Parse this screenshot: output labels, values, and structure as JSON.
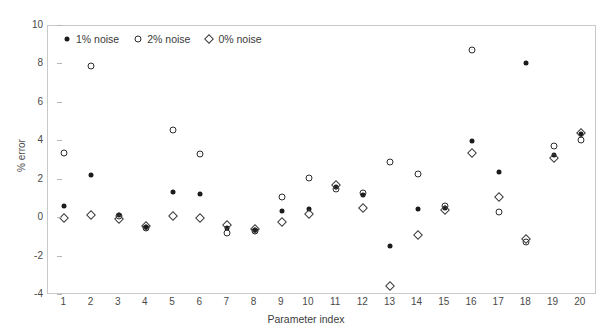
{
  "chart_data": {
    "type": "scatter",
    "title": "",
    "xlabel": "Parameter index",
    "ylabel": "% error",
    "xlim": [
      0.4,
      20.6
    ],
    "ylim": [
      -4,
      10
    ],
    "yticks": [
      10,
      8,
      6,
      4,
      2,
      0,
      -2,
      -4
    ],
    "ytick_labels": [
      "10",
      "8",
      "6",
      "4",
      "2",
      "0",
      "-2",
      "-4"
    ],
    "xticks": [
      1,
      2,
      3,
      4,
      5,
      6,
      7,
      8,
      9,
      10,
      11,
      12,
      13,
      14,
      15,
      16,
      17,
      18,
      19,
      20
    ],
    "xtick_labels": [
      "1",
      "2",
      "3",
      "4",
      "5",
      "6",
      "7",
      "8",
      "9",
      "10",
      "11",
      "12",
      "13",
      "14",
      "15",
      "16",
      "17",
      "18",
      "19",
      "20"
    ],
    "grid": false,
    "legend_position": "top-left-inside",
    "categories": [
      1,
      2,
      3,
      4,
      5,
      6,
      7,
      8,
      9,
      10,
      11,
      12,
      13,
      14,
      15,
      16,
      17,
      18,
      19,
      20
    ],
    "series": [
      {
        "name": "1% noise",
        "marker": "filled-circle",
        "color": "#1b1b1b",
        "values": [
          0.65,
          2.25,
          0.15,
          -0.45,
          1.35,
          1.25,
          -0.5,
          -0.6,
          0.35,
          0.45,
          1.6,
          1.2,
          -1.45,
          0.5,
          0.55,
          4.0,
          2.4,
          8.05,
          3.3,
          4.4
        ]
      },
      {
        "name": "2% noise",
        "marker": "open-circle",
        "color": "#2b2b2b",
        "values": [
          3.4,
          7.9,
          0.1,
          -0.5,
          4.6,
          3.35,
          -0.75,
          -0.65,
          1.1,
          2.1,
          1.5,
          1.3,
          2.9,
          2.3,
          0.65,
          8.75,
          0.3,
          -1.25,
          3.75,
          4.05
        ]
      },
      {
        "name": "0% noise",
        "marker": "open-diamond",
        "color": "#3a3a3a",
        "values": [
          0.0,
          0.15,
          -0.05,
          -0.4,
          0.1,
          0.0,
          -0.35,
          -0.55,
          -0.2,
          0.2,
          1.75,
          0.55,
          -3.55,
          -0.9,
          0.4,
          3.4,
          1.1,
          -1.1,
          3.15,
          4.45
        ]
      }
    ],
    "legend": [
      {
        "label": "1% noise",
        "marker": "filled-circle"
      },
      {
        "label": "2% noise",
        "marker": "open-circle"
      },
      {
        "label": "0% noise",
        "marker": "open-diamond"
      }
    ]
  }
}
